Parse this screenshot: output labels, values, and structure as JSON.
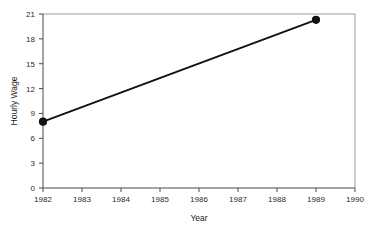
{
  "chart_data": {
    "type": "line",
    "title": "",
    "subtitle": "",
    "xlabel": "Year",
    "ylabel": "Hourly Wage",
    "x": [
      1982,
      1989
    ],
    "values": [
      8.0,
      20.3
    ],
    "series": [
      {
        "name": "Hourly Wage",
        "x": [
          1982,
          1989
        ],
        "values": [
          8.0,
          20.3
        ]
      }
    ],
    "xlim": [
      1982,
      1990
    ],
    "ylim": [
      0,
      21
    ],
    "xticks": [
      1982,
      1983,
      1984,
      1985,
      1986,
      1987,
      1988,
      1989,
      1990
    ],
    "xtick_labels": [
      "1982",
      "1983",
      "1984",
      "1985",
      "1986",
      "1987",
      "1988",
      "1989",
      "1990"
    ],
    "yticks": [
      0,
      3,
      6,
      9,
      12,
      15,
      18,
      21
    ],
    "ytick_labels": [
      "0",
      "3",
      "6",
      "9",
      "12",
      "15",
      "18",
      "21"
    ],
    "grid": false,
    "legend": null,
    "legend_position": "none",
    "marker": "filled-circle",
    "line_color": "#111111",
    "marker_color": "#111111",
    "frame_color": "#9a9a9a",
    "axis_color": "#4a4a4a",
    "background_color": "#ffffff",
    "annotations": []
  },
  "axis_titles": {
    "x": "Year",
    "y": "Hourly Wage"
  }
}
